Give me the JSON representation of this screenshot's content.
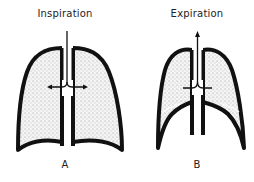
{
  "panels": [
    {
      "id": "A",
      "title": "Inspiration",
      "letter": "A",
      "airflow": "inward"
    },
    {
      "id": "B",
      "title": "Expiration",
      "letter": "B",
      "airflow": "outward"
    }
  ],
  "colors": {
    "outline": "#111111",
    "stipple": "#9a9a9a",
    "background": "#ffffff"
  }
}
